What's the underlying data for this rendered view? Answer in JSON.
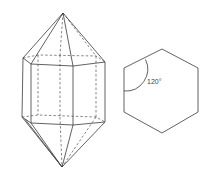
{
  "figure": {
    "left": {
      "name": "hexagonal-bipyramid-prism",
      "description": "Hexagonal prism capped with hexagonal pyramids on top and bottom; hidden edges dashed"
    },
    "right": {
      "name": "regular-hexagon",
      "angle_label": "120°"
    }
  }
}
